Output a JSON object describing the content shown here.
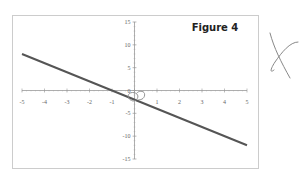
{
  "chart_data": {
    "type": "line",
    "title": "Figure 4",
    "xlabel": "",
    "ylabel": "",
    "xlim": [
      -5,
      5
    ],
    "ylim": [
      -15,
      15
    ],
    "x_ticks": [
      -5,
      -4,
      -3,
      -2,
      -1,
      0,
      1,
      2,
      3,
      4,
      5
    ],
    "y_ticks": [
      15,
      10,
      5,
      0,
      -5,
      -10,
      -15
    ],
    "grid": false,
    "legend": null,
    "series": [
      {
        "name": "y = -2x - 2",
        "x": [
          -5,
          5
        ],
        "y": [
          8,
          -12
        ],
        "color": "#555555"
      }
    ],
    "annotations": [
      {
        "type": "circle",
        "note": "hand-drawn circle near y-intercept (0, -2)"
      },
      {
        "type": "mark",
        "note": "hand-drawn X to the right of the chart"
      }
    ]
  },
  "colors": {
    "line": "#555555",
    "axis": "#999999",
    "frame": "#cccccc",
    "pen": "#888888"
  }
}
